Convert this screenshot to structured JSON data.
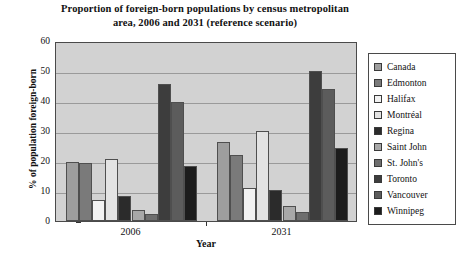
{
  "chart_data": {
    "type": "bar",
    "title": "Proportion of foreign-born populations by census metropolitan area, 2006 and 2031 (reference scenario)",
    "title_line1": "Proportion of foreign-born populations by census metropolitan",
    "title_line2": "area, 2006 and 2031 (reference scenario)",
    "xlabel": "Year",
    "ylabel": "% of population foreign-born",
    "categories": [
      "2006",
      "2031"
    ],
    "ylim": [
      0,
      60
    ],
    "ytick_labels": [
      "0",
      "10",
      "20",
      "30",
      "40",
      "50",
      "60"
    ],
    "ytick_values": [
      0,
      10,
      20,
      30,
      40,
      50,
      60
    ],
    "grid": true,
    "legend_position": "right",
    "series": [
      {
        "name": "Canada",
        "color": "#9e9e9e",
        "values": [
          19.8,
          26.2
        ]
      },
      {
        "name": "Edmonton",
        "color": "#7a7a7a",
        "values": [
          19.3,
          22.1
        ]
      },
      {
        "name": "Halifax",
        "color": "#f2f2f2",
        "values": [
          7.0,
          11.0
        ]
      },
      {
        "name": "Montréal",
        "color": "#e3e3e3",
        "values": [
          20.8,
          30.0
        ]
      },
      {
        "name": "Regina",
        "color": "#2b2b2b",
        "values": [
          8.5,
          10.2
        ]
      },
      {
        "name": "Saint John",
        "color": "#a8a8a8",
        "values": [
          3.6,
          5.0
        ]
      },
      {
        "name": "St. John's",
        "color": "#6e6e6e",
        "values": [
          2.4,
          3.1
        ]
      },
      {
        "name": "Toronto",
        "color": "#3d3d3d",
        "values": [
          45.7,
          50.0
        ]
      },
      {
        "name": "Vancouver",
        "color": "#5c5c5c",
        "values": [
          39.6,
          44.0
        ]
      },
      {
        "name": "Winnipeg",
        "color": "#1c1c1c",
        "values": [
          18.4,
          24.4
        ]
      }
    ]
  },
  "legend": {
    "items": [
      {
        "label": "Canada"
      },
      {
        "label": "Edmonton"
      },
      {
        "label": "Halifax"
      },
      {
        "label": "Montréal"
      },
      {
        "label": "Regina"
      },
      {
        "label": "Saint John"
      },
      {
        "label": "St. John's"
      },
      {
        "label": "Toronto"
      },
      {
        "label": "Vancouver"
      },
      {
        "label": "Winnipeg"
      }
    ]
  },
  "colors": {
    "plot_background": "#d2d2d2",
    "gridline": "#9a9a9a",
    "axis": "#4a4a4a",
    "text": "#111111",
    "page_background": "#ffffff"
  }
}
